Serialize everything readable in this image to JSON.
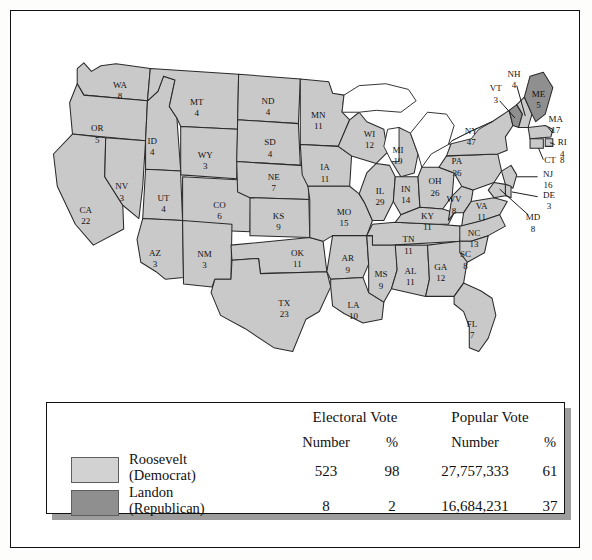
{
  "figure": {
    "colors": {
      "democrat_fill": "#c9c9c9",
      "republican_fill": "#8f8f8f",
      "swatch_democrat": "#d2d2d2",
      "swatch_republican": "#8f8f8f",
      "border": "#2a2a2a",
      "lake": "#ffffff",
      "shadow": "#9d9d9d"
    }
  },
  "map": {
    "lakes_label": "great-lakes",
    "states": [
      {
        "code": "WA",
        "votes": "8",
        "party": "democrat",
        "x": 100,
        "y": 56,
        "lx": 100,
        "ly": 68
      },
      {
        "code": "OR",
        "votes": "5",
        "party": "democrat",
        "x": 76,
        "y": 102,
        "lx": 76,
        "ly": 114
      },
      {
        "code": "CA",
        "votes": "22",
        "party": "democrat",
        "x": 64,
        "y": 188,
        "lx": 64,
        "ly": 200
      },
      {
        "code": "NV",
        "votes": "3",
        "party": "democrat",
        "x": 102,
        "y": 163,
        "lx": 102,
        "ly": 175
      },
      {
        "code": "ID",
        "votes": "4",
        "party": "democrat",
        "x": 134,
        "y": 115,
        "lx": 134,
        "ly": 127
      },
      {
        "code": "MT",
        "votes": "4",
        "party": "democrat",
        "x": 181,
        "y": 74,
        "lx": 181,
        "ly": 86
      },
      {
        "code": "WY",
        "votes": "3",
        "party": "democrat",
        "x": 190,
        "y": 130,
        "lx": 190,
        "ly": 142
      },
      {
        "code": "UT",
        "votes": "4",
        "party": "democrat",
        "x": 146,
        "y": 175,
        "lx": 146,
        "ly": 187
      },
      {
        "code": "CO",
        "votes": "6",
        "party": "democrat",
        "x": 205,
        "y": 183,
        "lx": 205,
        "ly": 195
      },
      {
        "code": "AZ",
        "votes": "3",
        "party": "democrat",
        "x": 137,
        "y": 233,
        "lx": 137,
        "ly": 245
      },
      {
        "code": "NM",
        "votes": "3",
        "party": "democrat",
        "x": 189,
        "y": 234,
        "lx": 189,
        "ly": 246
      },
      {
        "code": "ND",
        "votes": "4",
        "party": "democrat",
        "x": 256,
        "y": 73,
        "lx": 256,
        "ly": 85
      },
      {
        "code": "SD",
        "votes": "4",
        "party": "democrat",
        "x": 258,
        "y": 117,
        "lx": 258,
        "ly": 129
      },
      {
        "code": "NE",
        "votes": "7",
        "party": "democrat",
        "x": 262,
        "y": 153,
        "lx": 262,
        "ly": 165
      },
      {
        "code": "KS",
        "votes": "9",
        "party": "democrat",
        "x": 267,
        "y": 194,
        "lx": 267,
        "ly": 206
      },
      {
        "code": "OK",
        "votes": "11",
        "party": "democrat",
        "x": 287,
        "y": 233,
        "lx": 287,
        "ly": 245
      },
      {
        "code": "TX",
        "votes": "23",
        "party": "democrat",
        "x": 273,
        "y": 286,
        "lx": 273,
        "ly": 298
      },
      {
        "code": "MN",
        "votes": "11",
        "party": "democrat",
        "x": 309,
        "y": 88,
        "lx": 309,
        "ly": 100
      },
      {
        "code": "IA",
        "votes": "11",
        "party": "democrat",
        "x": 316,
        "y": 143,
        "lx": 316,
        "ly": 155
      },
      {
        "code": "MO",
        "votes": "15",
        "party": "democrat",
        "x": 336,
        "y": 190,
        "lx": 336,
        "ly": 202
      },
      {
        "code": "AR",
        "votes": "9",
        "party": "democrat",
        "x": 340,
        "y": 239,
        "lx": 340,
        "ly": 251
      },
      {
        "code": "LA",
        "votes": "10",
        "party": "democrat",
        "x": 346,
        "y": 288,
        "lx": 346,
        "ly": 300
      },
      {
        "code": "WI",
        "votes": "12",
        "party": "democrat",
        "x": 363,
        "y": 108,
        "lx": 363,
        "ly": 120
      },
      {
        "code": "IL",
        "votes": "29",
        "party": "democrat",
        "x": 374,
        "y": 168,
        "lx": 374,
        "ly": 180
      },
      {
        "code": "MS",
        "votes": "9",
        "party": "democrat",
        "x": 375,
        "y": 256,
        "lx": 375,
        "ly": 268
      },
      {
        "code": "MI",
        "votes": "19",
        "party": "democrat",
        "x": 393,
        "y": 125,
        "lx": 393,
        "ly": 137
      },
      {
        "code": "IN",
        "votes": "14",
        "party": "democrat",
        "x": 401,
        "y": 166,
        "lx": 401,
        "ly": 178
      },
      {
        "code": "TN",
        "votes": "11",
        "party": "democrat",
        "x": 404,
        "y": 219,
        "lx": 404,
        "ly": 231
      },
      {
        "code": "AL",
        "votes": "11",
        "party": "democrat",
        "x": 406,
        "y": 252,
        "lx": 406,
        "ly": 264
      },
      {
        "code": "OH",
        "votes": "26",
        "party": "democrat",
        "x": 432,
        "y": 158,
        "lx": 432,
        "ly": 170
      },
      {
        "code": "KY",
        "votes": "11",
        "party": "democrat",
        "x": 424,
        "y": 194,
        "lx": 424,
        "ly": 206
      },
      {
        "code": "GA",
        "votes": "12",
        "party": "democrat",
        "x": 438,
        "y": 248,
        "lx": 438,
        "ly": 260
      },
      {
        "code": "WV",
        "votes": "8",
        "party": "democrat",
        "x": 452,
        "y": 177,
        "lx": 452,
        "ly": 189
      },
      {
        "code": "VA",
        "votes": "11",
        "party": "democrat",
        "x": 481,
        "y": 184,
        "lx": 481,
        "ly": 196
      },
      {
        "code": "NC",
        "votes": "13",
        "party": "democrat",
        "x": 473,
        "y": 212,
        "lx": 473,
        "ly": 224
      },
      {
        "code": "SC",
        "votes": "8",
        "party": "democrat",
        "x": 464,
        "y": 235,
        "lx": 464,
        "ly": 247
      },
      {
        "code": "FL",
        "votes": "7",
        "party": "democrat",
        "x": 471,
        "y": 308,
        "lx": 471,
        "ly": 320
      },
      {
        "code": "PA",
        "votes": "36",
        "party": "democrat",
        "x": 455,
        "y": 137,
        "lx": 455,
        "ly": 149
      },
      {
        "code": "NY",
        "votes": "47",
        "party": "democrat",
        "x": 470,
        "y": 105,
        "lx": 470,
        "ly": 117
      },
      {
        "code": "VT",
        "votes": "3",
        "party": "republican",
        "x": 496,
        "y": 60,
        "lx": 496,
        "ly": 72
      },
      {
        "code": "NH",
        "votes": "4",
        "party": "democrat",
        "x": 515,
        "y": 45,
        "lx": 515,
        "ly": 57
      },
      {
        "code": "ME",
        "votes": "5",
        "party": "republican",
        "x": 541,
        "y": 66,
        "lx": 541,
        "ly": 78
      },
      {
        "code": "MA",
        "votes": "17",
        "party": "democrat",
        "x": 559,
        "y": 92,
        "lx": 559,
        "ly": 104
      },
      {
        "code": "RI",
        "votes": "4",
        "party": "democrat",
        "x": 566,
        "y": 117,
        "lx": 566,
        "ly": 129
      },
      {
        "code": "CT",
        "votes": "8",
        "party": "democrat",
        "x": 553,
        "y": 135,
        "lx": 566,
        "ly": 135
      },
      {
        "code": "NJ",
        "votes": "16",
        "party": "democrat",
        "x": 551,
        "y": 150,
        "lx": 551,
        "ly": 162
      },
      {
        "code": "DE",
        "votes": "3",
        "party": "democrat",
        "x": 552,
        "y": 172,
        "lx": 552,
        "ly": 184
      },
      {
        "code": "MD",
        "votes": "8",
        "party": "democrat",
        "x": 535,
        "y": 196,
        "lx": 535,
        "ly": 208
      }
    ]
  },
  "legend": {
    "headers": {
      "electoral_vote": "Electoral Vote",
      "popular_vote": "Popular Vote",
      "number_electoral": "Number",
      "percent_electoral": "%",
      "number_popular": "Number",
      "percent_popular": "%"
    },
    "rows": [
      {
        "candidate": "Roosevelt",
        "party": "(Democrat)",
        "swatch": "democrat",
        "electoral_number": "523",
        "electoral_percent": "98",
        "popular_number": "27,757,333",
        "popular_percent": "61"
      },
      {
        "candidate": "Landon",
        "party": "(Republican)",
        "swatch": "republican",
        "electoral_number": "8",
        "electoral_percent": "2",
        "popular_number": "16,684,231",
        "popular_percent": "37"
      }
    ]
  }
}
